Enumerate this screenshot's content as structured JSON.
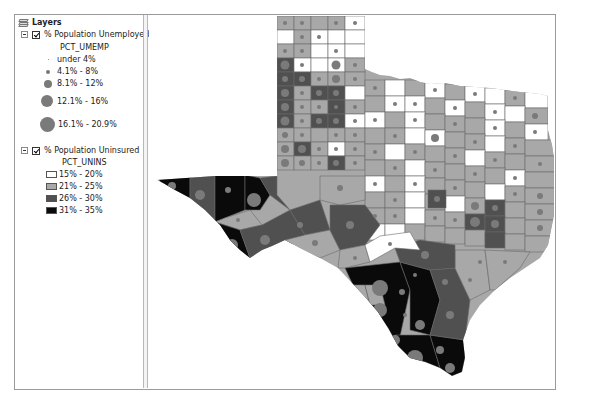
{
  "toc": {
    "root_label": "Layers",
    "layers": [
      {
        "name": "% Population Unemployed",
        "checked": true,
        "field": "PCT_UMEMP",
        "symbol_type": "graduated-symbol",
        "classes": [
          {
            "label": "under 4%",
            "size": 1
          },
          {
            "label": "4.1% - 8%",
            "size": 4
          },
          {
            "label": "8.1% - 12%",
            "size": 8
          },
          {
            "label": "12.1% - 16%",
            "size": 12
          },
          {
            "label": "16.1% - 20.9%",
            "size": 15
          }
        ],
        "symbol_color": "#7a7a7a"
      },
      {
        "name": "% Population Uninsured",
        "checked": true,
        "field": "PCT_UNINS",
        "symbol_type": "graduated-color",
        "classes": [
          {
            "label": "15% - 20%",
            "color": "#ffffff"
          },
          {
            "label": "21% - 25%",
            "color": "#a8a8a8"
          },
          {
            "label": "26% - 30%",
            "color": "#505050"
          },
          {
            "label": "31% - 35%",
            "color": "#0a0a0a"
          }
        ]
      }
    ]
  },
  "map": {
    "subject": "Texas counties",
    "county_border_color": "#6a6a6a"
  }
}
